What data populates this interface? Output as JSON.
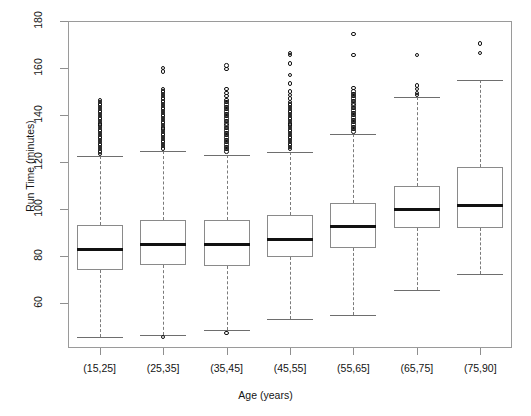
{
  "chart_data": {
    "type": "box",
    "title": "",
    "xlabel": "Age (years)",
    "ylabel": "Run Time (minutes)",
    "categories": [
      "(15,25]",
      "(25,35]",
      "(35,45]",
      "(45,55]",
      "(55,65]",
      "(65,75]",
      "(75,90]"
    ],
    "ylim": [
      41,
      180
    ],
    "yticks": [
      60,
      80,
      100,
      120,
      140,
      160,
      180
    ],
    "ytick_labels": [
      "60",
      "80",
      "100",
      "120",
      "140",
      "160",
      "180"
    ],
    "grid": false,
    "legend": false,
    "boxes": [
      {
        "category": "(15,25]",
        "whisker_low": 45.5,
        "q1": 74.2,
        "median": 82.8,
        "q3": 93.1,
        "whisker_high": 122.5,
        "outliers_high": [
          123.5,
          124.5,
          125.5,
          126.5,
          127.5,
          128.5,
          129.5,
          130.5,
          131.5,
          132.5,
          133.5,
          134.5,
          135.5,
          136.5,
          137.5,
          138.5,
          139.5,
          140.5,
          141.5,
          142.5,
          143.5,
          144.5,
          145.5,
          146.5
        ],
        "outliers_low": []
      },
      {
        "category": "(25,35]",
        "whisker_low": 46.5,
        "q1": 76.2,
        "median": 85.2,
        "q3": 95.5,
        "whisker_high": 124.8,
        "outliers_high": [
          125.8,
          126.8,
          127.8,
          128.8,
          129.8,
          130.8,
          131.8,
          132.8,
          133.8,
          134.8,
          135.8,
          136.8,
          137.8,
          138.8,
          139.8,
          140.8,
          141.8,
          142.8,
          143.8,
          144.8,
          145.8,
          147.0,
          148.0,
          149.0,
          150.0,
          151.0,
          158.5,
          160.0
        ],
        "outliers_low": [
          45.8
        ]
      },
      {
        "category": "(35,45]",
        "whisker_low": 48.5,
        "q1": 76.0,
        "median": 85.0,
        "q3": 95.5,
        "whisker_high": 123.0,
        "outliers_high": [
          124.5,
          125.5,
          126.5,
          127.5,
          128.5,
          129.5,
          130.5,
          131.5,
          132.5,
          133.5,
          134.5,
          135.5,
          136.5,
          137.5,
          138.5,
          139.5,
          140.5,
          141.5,
          142.5,
          143.5,
          144.5,
          145.5,
          146.5,
          148.0,
          149.5,
          151.0,
          159.5,
          161.0
        ],
        "outliers_low": [
          47.5
        ]
      },
      {
        "category": "(45,55]",
        "whisker_low": 53.5,
        "q1": 79.5,
        "median": 87.2,
        "q3": 97.5,
        "whisker_high": 124.5,
        "outliers_high": [
          125.5,
          126.5,
          127.5,
          128.5,
          129.5,
          130.5,
          131.5,
          132.5,
          133.5,
          134.5,
          135.5,
          136.5,
          137.5,
          138.5,
          139.5,
          140.5,
          141.5,
          142.5,
          143.5,
          144.5,
          145.5,
          147.0,
          148.5,
          150.0,
          153.5,
          157.0,
          162.0,
          165.5,
          166.5
        ],
        "outliers_low": []
      },
      {
        "category": "(55,65]",
        "whisker_low": 55.0,
        "q1": 83.5,
        "median": 92.5,
        "q3": 102.5,
        "whisker_high": 132.0,
        "outliers_high": [
          133.0,
          134.0,
          135.0,
          136.0,
          137.0,
          138.0,
          139.0,
          140.0,
          141.0,
          142.0,
          143.0,
          144.0,
          145.0,
          146.0,
          147.0,
          148.0,
          149.0,
          150.0,
          151.5,
          165.5,
          174.5
        ],
        "outliers_low": []
      },
      {
        "category": "(65,75]",
        "whisker_low": 65.5,
        "q1": 92.0,
        "median": 99.8,
        "q3": 110.0,
        "whisker_high": 147.5,
        "outliers_high": [
          148.5,
          149.5,
          151.0,
          152.5,
          165.5
        ],
        "outliers_low": []
      },
      {
        "category": "(75,90]",
        "whisker_low": 72.5,
        "q1": 92.0,
        "median": 101.5,
        "q3": 118.0,
        "whisker_high": 155.0,
        "outliers_high": [
          166.5,
          170.5
        ],
        "outliers_low": []
      }
    ]
  },
  "axes": {
    "ylabel": "Run Time (minutes)",
    "xlabel": "Age (years)"
  }
}
